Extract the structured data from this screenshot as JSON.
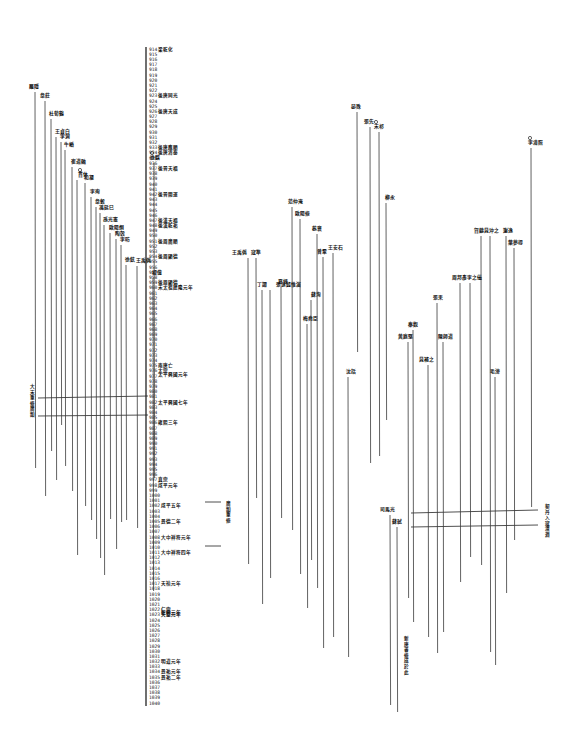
{
  "document": {
    "type": "historical timeline chart (scanned page)",
    "axis": {
      "x": 146,
      "y_top": 49,
      "y_bottom": 703,
      "start_year": 914,
      "end_year": 1040,
      "label_x": 149
    },
    "era_notes": [
      {
        "year": 914,
        "text": "梁乾化"
      },
      {
        "year": 923,
        "text": "後唐同光"
      },
      {
        "year": 926,
        "text": "後唐天成"
      },
      {
        "year": 933,
        "text": "後唐應順"
      },
      {
        "year": 934,
        "text": "後唐清泰"
      },
      {
        "year": 937,
        "text": "後晉天福"
      },
      {
        "year": 942,
        "text": "後晉開運"
      },
      {
        "year": 947,
        "text": "後漢天福"
      },
      {
        "year": 948,
        "text": "後漢乾祐"
      },
      {
        "year": 951,
        "text": "後周廣順"
      },
      {
        "year": 954,
        "text": "後周顯德"
      },
      {
        "year": 959,
        "text": "後周顯德"
      },
      {
        "year": 960,
        "text": "宋太祖建隆元年"
      },
      {
        "year": 975,
        "text": "南唐亡"
      },
      {
        "year": 976,
        "text": "太宗"
      },
      {
        "year": 976.6,
        "text": "太平興國元年"
      },
      {
        "year": 982,
        "text": "太平興國七年"
      },
      {
        "year": 986,
        "text": "雍熙三年"
      },
      {
        "year": 997,
        "text": "真宗"
      },
      {
        "year": 998,
        "text": "咸平元年"
      },
      {
        "year": 1002,
        "text": "咸平五年"
      },
      {
        "year": 1005,
        "text": "景德二年"
      },
      {
        "year": 1008,
        "text": "大中祥符元年"
      },
      {
        "year": 1011,
        "text": "大中祥符四年"
      },
      {
        "year": 1017,
        "text": "天禧元年"
      },
      {
        "year": 1022,
        "text": "仁宗"
      },
      {
        "year": 1022.6,
        "text": "乾興元年"
      },
      {
        "year": 1023,
        "text": "天聖元年"
      },
      {
        "year": 1032,
        "text": "明道元年"
      },
      {
        "year": 1034,
        "text": "景祐元年"
      },
      {
        "year": 1035,
        "text": "景祐二年"
      }
    ],
    "vertical_notes": [
      {
        "x": 30,
        "y": 388,
        "text": "大宋重修廣韻"
      },
      {
        "x": 226,
        "y": 505,
        "text": "廣韻重修"
      },
      {
        "x": 404,
        "y": 640,
        "text": "新唐書修成於此"
      },
      {
        "x": 545,
        "y": 508,
        "text": "契丹入寇澶淵"
      }
    ],
    "lifelines": [
      {
        "x": 35,
        "top": 92,
        "bottom": 468,
        "label": "羅隱",
        "lx": 29,
        "ly": 88
      },
      {
        "x": 45,
        "top": 101,
        "bottom": 496,
        "label": "韋莊",
        "lx": 40,
        "ly": 97
      },
      {
        "x": 51,
        "top": 119,
        "bottom": 451,
        "label": "杜荀鶴",
        "lx": 49,
        "ly": 115
      },
      {
        "x": 56,
        "top": 137,
        "bottom": 480,
        "label": "王貞白",
        "lx": 55,
        "ly": 133
      },
      {
        "x": 61,
        "top": 142,
        "bottom": 425,
        "label": "李洞",
        "lx": 60,
        "ly": 138
      },
      {
        "x": 65,
        "top": 150,
        "bottom": 466,
        "label": "牛嶠",
        "lx": 64,
        "ly": 146
      },
      {
        "x": 72,
        "top": 167,
        "bottom": 491,
        "label": "崔道融",
        "lx": 71,
        "ly": 163
      },
      {
        "x": 77,
        "top": 180,
        "bottom": 555,
        "label": "貫休",
        "lx": 78,
        "ly": 176,
        "ring": true
      },
      {
        "x": 85,
        "top": 183,
        "bottom": 506,
        "label": "和凝",
        "lx": 84,
        "ly": 179
      },
      {
        "x": 91,
        "top": 197,
        "bottom": 520,
        "label": "李珣",
        "lx": 90,
        "ly": 193
      },
      {
        "x": 96,
        "top": 207,
        "bottom": 539,
        "label": "韋縠",
        "lx": 95,
        "ly": 203
      },
      {
        "x": 100,
        "top": 213,
        "bottom": 558,
        "label": "馮延巳",
        "lx": 99,
        "ly": 209
      },
      {
        "x": 104,
        "top": 225,
        "bottom": 575,
        "label": "孫光憲",
        "lx": 103,
        "ly": 221
      },
      {
        "x": 110,
        "top": 233,
        "bottom": 519,
        "label": "歐陽炯",
        "lx": 109,
        "ly": 229
      },
      {
        "x": 116,
        "top": 239,
        "bottom": 549,
        "label": "陶穀",
        "lx": 115,
        "ly": 235
      },
      {
        "x": 121,
        "top": 245,
        "bottom": 522,
        "label": "李昉",
        "lx": 120,
        "ly": 241
      },
      {
        "x": 126,
        "top": 265,
        "bottom": 520,
        "label": "徐鉉",
        "lx": 125,
        "ly": 261
      },
      {
        "x": 137,
        "top": 266,
        "bottom": 528,
        "label": "王禹偁",
        "lx": 136,
        "ly": 262
      },
      {
        "x": 153,
        "top": 278,
        "bottom": 591,
        "label": "楊億",
        "lx": 152,
        "ly": 274
      },
      {
        "x": 154,
        "top": 163,
        "bottom": 478,
        "label": "徐鍇",
        "lx": 150,
        "ly": 159,
        "ring": true
      },
      {
        "x": 248,
        "top": 258,
        "bottom": 564,
        "label": "王禹偁",
        "lx": 232,
        "ly": 254
      },
      {
        "x": 256,
        "top": 258,
        "bottom": 498,
        "label": "寇準",
        "lx": 251,
        "ly": 254
      },
      {
        "x": 262,
        "top": 290,
        "bottom": 604,
        "label": "丁謂",
        "lx": 257,
        "ly": 286
      },
      {
        "x": 270,
        "top": 290,
        "bottom": 578,
        "label": "張詠錢惟演",
        "lx": 276,
        "ly": 286
      },
      {
        "x": 281,
        "top": 287,
        "bottom": 518,
        "label": "夏竦",
        "lx": 278,
        "ly": 283
      },
      {
        "x": 292,
        "top": 207,
        "bottom": 530,
        "label": "范仲淹",
        "lx": 288,
        "ly": 203
      },
      {
        "x": 300,
        "top": 219,
        "bottom": 574,
        "label": "歐陽修",
        "lx": 295,
        "ly": 215
      },
      {
        "x": 307,
        "top": 324,
        "bottom": 608,
        "label": "梅堯臣",
        "lx": 303,
        "ly": 320
      },
      {
        "x": 317,
        "top": 234,
        "bottom": 588,
        "label": "蔡襄",
        "lx": 312,
        "ly": 230
      },
      {
        "x": 323,
        "top": 257,
        "bottom": 648,
        "label": "曾鞏",
        "lx": 317,
        "ly": 253
      },
      {
        "x": 333,
        "top": 253,
        "bottom": 637,
        "label": "王安石",
        "lx": 328,
        "ly": 249
      },
      {
        "x": 311,
        "top": 300,
        "bottom": 560,
        "label": "蘇洵",
        "lx": 311,
        "ly": 296
      },
      {
        "x": 348,
        "top": 377,
        "bottom": 657,
        "label": "沈括",
        "lx": 346,
        "ly": 373
      },
      {
        "x": 357,
        "top": 112,
        "bottom": 352,
        "label": "晏殊",
        "lx": 351,
        "ly": 108
      },
      {
        "x": 370,
        "top": 127,
        "bottom": 463,
        "label": "張先",
        "lx": 364,
        "ly": 123
      },
      {
        "x": 379,
        "top": 132,
        "bottom": 456,
        "label": "宋祁",
        "lx": 374,
        "ly": 128,
        "ring": true
      },
      {
        "x": 386,
        "top": 203,
        "bottom": 420,
        "label": "柳永",
        "lx": 385,
        "ly": 199
      },
      {
        "x": 390,
        "top": 515,
        "bottom": 705,
        "label": "司馬光",
        "lx": 380,
        "ly": 511
      },
      {
        "x": 397,
        "top": 527,
        "bottom": 712,
        "label": "蘇軾",
        "lx": 392,
        "ly": 523
      },
      {
        "x": 408,
        "top": 342,
        "bottom": 598,
        "label": "黃庭堅",
        "lx": 398,
        "ly": 338
      },
      {
        "x": 413,
        "top": 330,
        "bottom": 622,
        "label": "秦觀",
        "lx": 408,
        "ly": 326
      },
      {
        "x": 428,
        "top": 365,
        "bottom": 637,
        "label": "晁補之",
        "lx": 419,
        "ly": 361
      },
      {
        "x": 437,
        "top": 303,
        "bottom": 653,
        "label": "張耒",
        "lx": 433,
        "ly": 299
      },
      {
        "x": 443,
        "top": 342,
        "bottom": 632,
        "label": "陳師道",
        "lx": 438,
        "ly": 338
      },
      {
        "x": 460,
        "top": 283,
        "bottom": 582,
        "label": "周邦彥",
        "lx": 452,
        "ly": 279
      },
      {
        "x": 470,
        "top": 283,
        "bottom": 557,
        "label": "李之儀",
        "lx": 467,
        "ly": 279
      },
      {
        "x": 481,
        "top": 236,
        "bottom": 565,
        "label": "賀鑄",
        "lx": 474,
        "ly": 232
      },
      {
        "x": 490,
        "top": 236,
        "bottom": 652,
        "label": "晁沖之",
        "lx": 484,
        "ly": 232
      },
      {
        "x": 495,
        "top": 377,
        "bottom": 665,
        "label": "毛滂",
        "lx": 490,
        "ly": 373
      },
      {
        "x": 506,
        "top": 236,
        "bottom": 593,
        "label": "謝逸",
        "lx": 503,
        "ly": 232
      },
      {
        "x": 514,
        "top": 248,
        "bottom": 540,
        "label": "葉夢得",
        "lx": 508,
        "ly": 244
      },
      {
        "x": 531,
        "top": 148,
        "bottom": 507,
        "label": "李清照",
        "lx": 528,
        "ly": 144,
        "ring": true
      }
    ],
    "connectors": [
      {
        "x1": 38,
        "y1": 398,
        "x2": 148,
        "y2": 396
      },
      {
        "x1": 38,
        "y1": 416,
        "x2": 148,
        "y2": 415
      },
      {
        "x1": 205,
        "y1": 502,
        "x2": 221,
        "y2": 502
      },
      {
        "x1": 205,
        "y1": 546,
        "x2": 221,
        "y2": 546
      },
      {
        "x1": 411,
        "y1": 513,
        "x2": 538,
        "y2": 510
      },
      {
        "x1": 411,
        "y1": 527,
        "x2": 538,
        "y2": 525
      }
    ],
    "colors": {
      "ink": "#222222",
      "paper": "#ffffff"
    }
  }
}
